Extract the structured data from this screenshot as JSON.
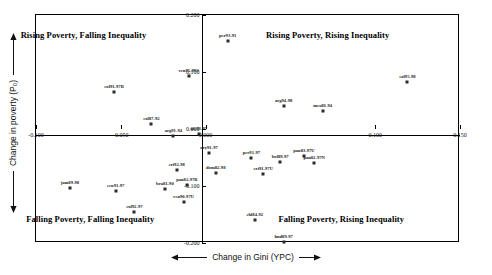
{
  "chart_data": {
    "type": "scatter",
    "title": "",
    "xlabel": "Change in Gini (YPC)",
    "ylabel": "Change in poverty (P₀)",
    "xlim": [
      -0.1,
      0.15
    ],
    "ylim": [
      -0.2,
      0.2
    ],
    "grid": false,
    "legend": "none",
    "xticks": [
      "-0.100",
      "-0.050",
      "0.000",
      "0.100",
      "0.150"
    ],
    "xtick_values": [
      -0.1,
      -0.05,
      0.0,
      0.1,
      0.15
    ],
    "yticks": [
      "0.200",
      "0.100",
      "0.000",
      "-0.100",
      "-0.200"
    ],
    "ytick_values": [
      0.2,
      0.1,
      0.0,
      -0.1,
      -0.2
    ],
    "quadrant_labels": [
      {
        "text": "Rising Poverty, Falling Inequality",
        "x": -0.072,
        "y": 0.165
      },
      {
        "text": "Rising Poverty, Rising Inequality",
        "x": 0.072,
        "y": 0.165
      },
      {
        "text": "Falling Poverty, Falling Inequality",
        "x": -0.068,
        "y": -0.158
      },
      {
        "text": "Falling Poverty, Rising Inequality",
        "x": 0.08,
        "y": -0.158
      }
    ],
    "points": [
      {
        "label": "per93-91",
        "x": 0.013,
        "y": 0.155
      },
      {
        "label": "ven95-99S",
        "x": -0.01,
        "y": 0.093
      },
      {
        "label": "col95-98",
        "x": 0.119,
        "y": 0.082
      },
      {
        "label": "col91-97B",
        "x": -0.054,
        "y": 0.065
      },
      {
        "label": "arg94-98",
        "x": 0.046,
        "y": 0.04
      },
      {
        "label": "mex86-94",
        "x": 0.069,
        "y": 0.031
      },
      {
        "label": "col87-92",
        "x": -0.032,
        "y": 0.008
      },
      {
        "label": "arg91-94",
        "x": -0.019,
        "y": -0.012
      },
      {
        "label": "nic91-97",
        "x": -0.004,
        "y": -0.008
      },
      {
        "label": "ury91-97",
        "x": 0.002,
        "y": -0.042
      },
      {
        "label": "per91-97",
        "x": 0.027,
        "y": -0.05
      },
      {
        "label": "pan83-97U",
        "x": 0.058,
        "y": -0.047
      },
      {
        "label": "bol89-97",
        "x": 0.044,
        "y": -0.058
      },
      {
        "label": "pan82-97N",
        "x": 0.064,
        "y": -0.06
      },
      {
        "label": "cri92-98",
        "x": -0.017,
        "y": -0.072
      },
      {
        "label": "dom82-98",
        "x": 0.006,
        "y": -0.078
      },
      {
        "label": "cri91-97U",
        "x": 0.034,
        "y": -0.079
      },
      {
        "label": "pan82-97R",
        "x": -0.011,
        "y": -0.098
      },
      {
        "label": "bra81-90",
        "x": -0.024,
        "y": -0.105
      },
      {
        "label": "ven90-97U",
        "x": -0.013,
        "y": -0.128
      },
      {
        "label": "chl84-92",
        "x": 0.029,
        "y": -0.16
      },
      {
        "label": "jam89-98",
        "x": -0.08,
        "y": -0.103
      },
      {
        "label": "ecu91-97",
        "x": -0.053,
        "y": -0.108
      },
      {
        "label": "col92-97",
        "x": -0.042,
        "y": -0.145
      },
      {
        "label": "hnd89-97",
        "x": 0.046,
        "y": -0.198
      }
    ]
  }
}
